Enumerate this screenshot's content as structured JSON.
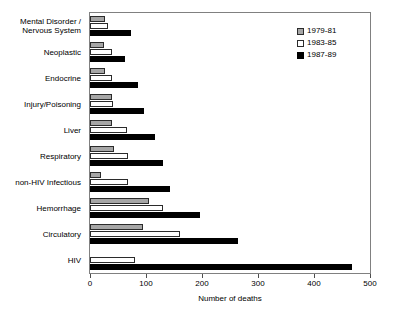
{
  "chart_data": {
    "type": "bar",
    "orientation": "horizontal",
    "title": "",
    "xlabel": "Number of deaths",
    "ylabel": "",
    "xlim": [
      0,
      500
    ],
    "xticks": [
      0,
      100,
      200,
      300,
      400,
      500
    ],
    "xtick_labels": [
      "0",
      "100",
      "200",
      "300",
      "400",
      "500"
    ],
    "grid": false,
    "legend_position": "top-right",
    "categories": [
      "Mental Disorder /\nNervous System",
      "Neoplastic",
      "Endocrine",
      "Injury/Poisoning",
      "Liver",
      "Respiratory",
      "non-HIV Infectious",
      "Hemorrhage",
      "Circulatory",
      "HIV"
    ],
    "series": [
      {
        "name": "1979-81",
        "color": "#a6a6a6",
        "values": [
          27,
          25,
          27,
          40,
          40,
          42,
          20,
          105,
          95,
          0
        ]
      },
      {
        "name": "1983-85",
        "color": "#ffffff",
        "values": [
          32,
          40,
          40,
          41,
          66,
          68,
          68,
          130,
          160,
          80
        ]
      },
      {
        "name": "1987-89",
        "color": "#000000",
        "values": [
          73,
          63,
          86,
          96,
          116,
          130,
          143,
          196,
          265,
          468
        ]
      }
    ]
  }
}
